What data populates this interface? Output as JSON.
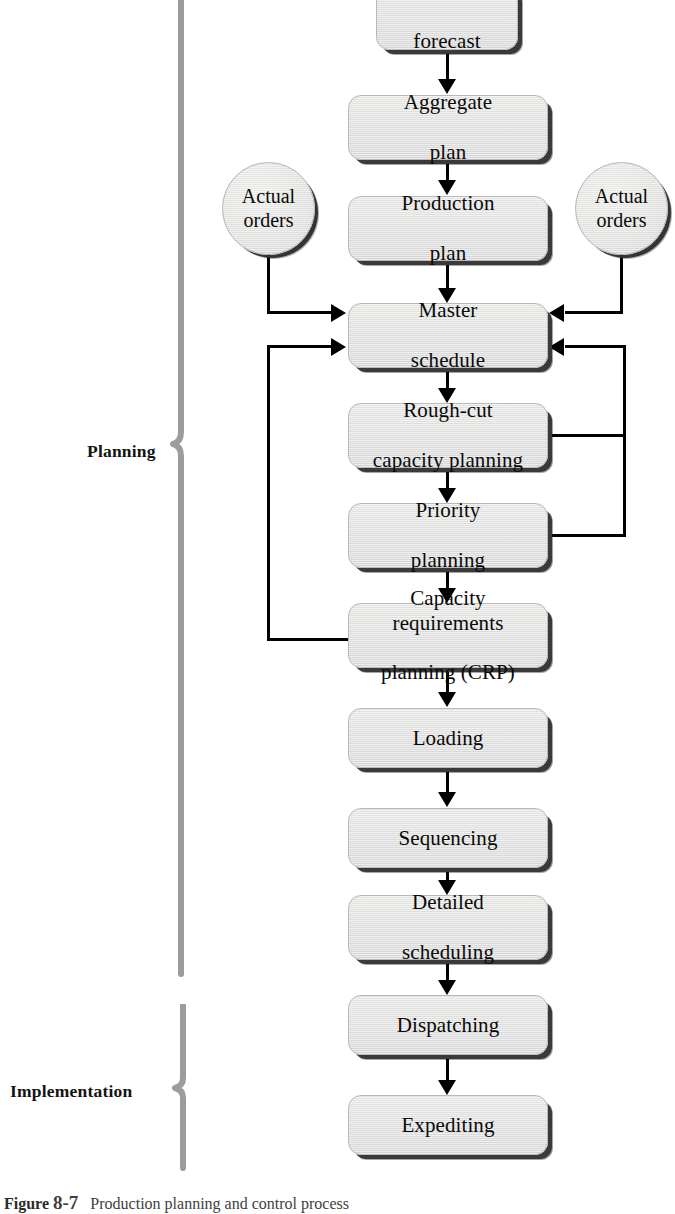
{
  "figure": {
    "caption_label": "Figure",
    "caption_number": "8-7",
    "caption_text": "Production planning and control process"
  },
  "groups": [
    {
      "id": "planning",
      "label": "Planning"
    },
    {
      "id": "implementation",
      "label": "Implementation"
    }
  ],
  "nodes": [
    {
      "id": "demand-forecast",
      "line1": "Demand",
      "line2": "forecast"
    },
    {
      "id": "aggregate-plan",
      "line1": "Aggregate",
      "line2": "plan"
    },
    {
      "id": "production-plan",
      "line1": "Production",
      "line2": "plan"
    },
    {
      "id": "master-schedule",
      "line1": "Master",
      "line2": "schedule"
    },
    {
      "id": "rough-cut",
      "line1": "Rough-cut",
      "line2": "capacity planning"
    },
    {
      "id": "priority-planning",
      "line1": "Priority",
      "line2": "planning"
    },
    {
      "id": "crp",
      "line1": "Capacity requirements",
      "line2": "planning (CRP)"
    },
    {
      "id": "loading",
      "line1": "Loading",
      "line2": ""
    },
    {
      "id": "sequencing",
      "line1": "Sequencing",
      "line2": ""
    },
    {
      "id": "detailed-sched",
      "line1": "Detailed",
      "line2": "scheduling"
    },
    {
      "id": "dispatching",
      "line1": "Dispatching",
      "line2": ""
    },
    {
      "id": "expediting",
      "line1": "Expediting",
      "line2": ""
    }
  ],
  "circles": [
    {
      "id": "actual-orders-left",
      "line1": "Actual",
      "line2": "orders"
    },
    {
      "id": "actual-orders-right",
      "line1": "Actual",
      "line2": "orders"
    }
  ],
  "colors": {
    "node_fill": "#dedede",
    "node_border": "#b9b9b9",
    "node_shadow": "#3a3a3a",
    "connector": "#000000",
    "brace": "#9a9a9a",
    "label_text": "#141414",
    "page_background": "#ffffff"
  },
  "flow": {
    "main_sequence": [
      "demand-forecast",
      "aggregate-plan",
      "production-plan",
      "master-schedule",
      "rough-cut",
      "priority-planning",
      "crp",
      "loading",
      "sequencing",
      "detailed-sched",
      "dispatching",
      "expediting"
    ],
    "feedback_edges": [
      {
        "from": "actual-orders-left",
        "to": "master-schedule"
      },
      {
        "from": "actual-orders-right",
        "to": "master-schedule"
      },
      {
        "from": "crp",
        "to": "master-schedule"
      },
      {
        "from": "rough-cut",
        "to": "master-schedule"
      },
      {
        "from": "priority-planning",
        "to": "master-schedule"
      }
    ]
  }
}
